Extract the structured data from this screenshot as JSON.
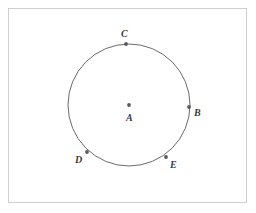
{
  "figure": {
    "kind": "circle-geometry-diagram",
    "frame": {
      "x": 8,
      "y": 8,
      "width": 239,
      "height": 195,
      "border_color": "#cfcfcf",
      "background_color": "#ffffff"
    },
    "stroke_color": "#6b6b6b",
    "point_color": "#5a5a5a",
    "label_color": "#3a3a3a",
    "circle": {
      "center_label": "A",
      "cx": 129,
      "cy": 105,
      "r": 61
    },
    "points": [
      {
        "label": "A",
        "role": "center",
        "x": 129,
        "y": 105,
        "label_x": 126,
        "label_y": 113
      },
      {
        "label": "B",
        "role": "on-circle",
        "x": 189,
        "y": 107,
        "label_x": 194,
        "label_y": 108
      },
      {
        "label": "C",
        "role": "on-circle",
        "x": 126,
        "y": 44,
        "label_x": 121,
        "label_y": 29
      },
      {
        "label": "D",
        "role": "on-circle",
        "x": 87,
        "y": 152,
        "label_x": 75,
        "label_y": 155
      },
      {
        "label": "E",
        "role": "on-circle",
        "x": 166,
        "y": 157,
        "label_x": 170,
        "label_y": 160
      }
    ]
  }
}
